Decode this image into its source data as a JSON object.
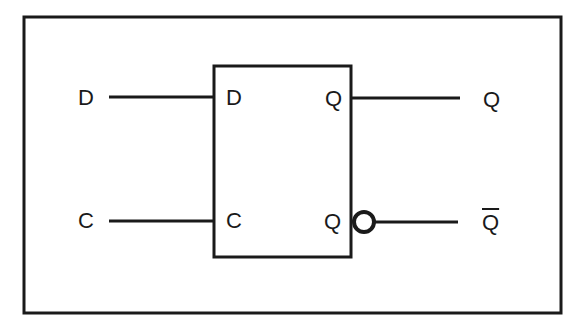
{
  "diagram": {
    "inputs": [
      {
        "external_label": "D",
        "pin_label": "D"
      },
      {
        "external_label": "C",
        "pin_label": "C"
      }
    ],
    "outputs": [
      {
        "pin_label": "Q",
        "external_label": "Q",
        "inverted": false
      },
      {
        "pin_label": "Q",
        "external_label": "Q",
        "inverted": true
      }
    ],
    "colors": {
      "stroke": "#1a1a1a",
      "background": "#ffffff"
    }
  }
}
